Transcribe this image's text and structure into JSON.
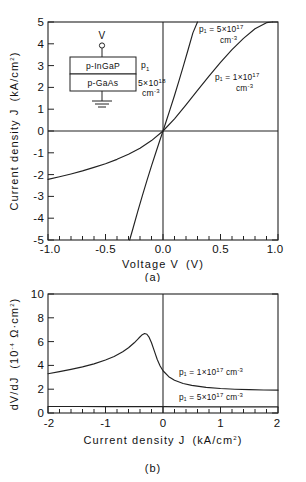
{
  "figure": {
    "panel_a_caption": "(a)",
    "panel_b_caption": "(b)"
  },
  "inset": {
    "terminal_label": "V",
    "top_layer": "p-InGaP",
    "bottom_layer": "p-GaAs",
    "p1_symbol": "p",
    "p1_subscript": "1",
    "doping_mantissa": "5×10",
    "doping_exponent": "18",
    "doping_units": "cm",
    "doping_units_exponent": "-3",
    "ground_name": "ground-symbol"
  },
  "chart_data": [
    {
      "type": "line",
      "panel": "(a)",
      "title": "",
      "xlabel": "Voltage V  (V)",
      "ylabel": "Current density J  (kA/cm²)",
      "xlabel_main": "Voltage V",
      "xlabel_unit": "(V)",
      "ylabel_main": "Current density J",
      "ylabel_unit": "(kA/cm",
      "ylabel_unit_sup": "2",
      "ylabel_unit_close": ")",
      "xlim": [
        -1.0,
        1.0
      ],
      "ylim": [
        -5,
        5
      ],
      "xticks": [
        -1.0,
        -0.5,
        0.0,
        0.5,
        1.0
      ],
      "xticklabels": [
        "-1.0",
        "-0.5",
        "0.0",
        "0.5",
        "1.0"
      ],
      "yticks": [
        -5,
        -4,
        -3,
        -2,
        -1,
        0,
        1,
        2,
        3,
        4,
        5
      ],
      "yticklabels": [
        "-5",
        "-4",
        "-3",
        "-2",
        "-1",
        "0",
        "1",
        "2",
        "3",
        "4",
        "5"
      ],
      "minor_xticks_per_interval": 5,
      "grid": false,
      "legend_position": "in-plot-annotations",
      "series": [
        {
          "name": "p1 = 5×10^17 cm^-3",
          "label_line1": "p₁ = 5×10",
          "label_sup": "17",
          "label_line2": "cm",
          "label_line2_sup": "-3",
          "x": [
            -0.29,
            -0.26,
            -0.22,
            -0.18,
            -0.14,
            -0.1,
            -0.06,
            -0.03,
            0.0,
            0.03,
            0.06,
            0.1,
            0.14,
            0.18,
            0.22,
            0.26,
            0.3
          ],
          "y": [
            -5.0,
            -4.45,
            -3.7,
            -2.98,
            -2.28,
            -1.6,
            -0.95,
            -0.47,
            0.0,
            0.48,
            0.97,
            1.63,
            2.32,
            3.03,
            3.76,
            4.5,
            5.0
          ]
        },
        {
          "name": "p1 = 1×10^17 cm^-3",
          "label_line1": "p₁ = 1×10",
          "label_sup": "17",
          "label_line2": "cm",
          "label_line2_sup": "-3",
          "x": [
            -1.0,
            -0.9,
            -0.8,
            -0.7,
            -0.6,
            -0.5,
            -0.4,
            -0.3,
            -0.2,
            -0.1,
            0.0,
            0.1,
            0.2,
            0.3,
            0.4,
            0.5,
            0.6,
            0.7,
            0.8,
            0.9,
            0.95
          ],
          "y": [
            -2.22,
            -2.1,
            -1.97,
            -1.83,
            -1.67,
            -1.5,
            -1.3,
            -1.07,
            -0.79,
            -0.44,
            0.0,
            0.56,
            1.2,
            1.86,
            2.52,
            3.15,
            3.73,
            4.25,
            4.69,
            4.97,
            5.0
          ]
        }
      ]
    },
    {
      "type": "line",
      "panel": "(b)",
      "title": "",
      "xlabel": "Current density J  (kA/cm²)",
      "ylabel": "dV/dJ  (10⁻⁴ Ω·cm²)",
      "xlabel_main": "Current density J",
      "xlabel_unit": "(kA/cm",
      "xlabel_unit_sup": "2",
      "xlabel_unit_close": ")",
      "ylabel_main": "dV/dJ",
      "ylabel_unit_open": "(10",
      "ylabel_unit_sup": "-4",
      "ylabel_unit_rest": " Ω·cm",
      "ylabel_unit_sup2": "2",
      "ylabel_unit_close": ")",
      "xlim": [
        -2,
        2
      ],
      "ylim": [
        0,
        10
      ],
      "xticks": [
        -2,
        -1,
        0,
        1,
        2
      ],
      "xticklabels": [
        "-2",
        "-1",
        "0",
        "1",
        "2"
      ],
      "yticks": [
        0,
        2,
        4,
        6,
        8,
        10
      ],
      "yticklabels": [
        "0",
        "2",
        "4",
        "6",
        "8",
        "10"
      ],
      "minor_xticks_per_interval": 5,
      "grid": false,
      "legend_position": "in-plot-annotations",
      "series": [
        {
          "name": "p1 = 1×10^17 cm^-3",
          "label_text": "p₁ = 1×10",
          "label_sup": "17",
          "label_tail": " cm",
          "label_tail_sup": "-3",
          "x": [
            -2.0,
            -1.8,
            -1.6,
            -1.4,
            -1.2,
            -1.0,
            -0.85,
            -0.7,
            -0.6,
            -0.5,
            -0.42,
            -0.36,
            -0.32,
            -0.28,
            -0.24,
            -0.2,
            -0.15,
            -0.1,
            -0.05,
            0.0,
            0.1,
            0.2,
            0.35,
            0.5,
            0.75,
            1.0,
            1.25,
            1.5,
            1.75,
            2.0
          ],
          "y": [
            3.3,
            3.48,
            3.67,
            3.88,
            4.13,
            4.45,
            4.75,
            5.15,
            5.48,
            5.9,
            6.3,
            6.58,
            6.68,
            6.62,
            6.35,
            5.9,
            5.2,
            4.5,
            3.95,
            3.55,
            3.05,
            2.75,
            2.48,
            2.32,
            2.15,
            2.06,
            2.0,
            1.96,
            1.93,
            1.92
          ]
        },
        {
          "name": "p1 = 5×10^17 cm^-3",
          "label_text": "p₁ = 5×10",
          "label_sup": "17",
          "label_tail": " cm",
          "label_tail_sup": "-3",
          "x": [
            -2.0,
            -1.5,
            -1.0,
            -0.5,
            0.0,
            0.5,
            1.0,
            1.5,
            2.0
          ],
          "y": [
            0.55,
            0.55,
            0.54,
            0.54,
            0.53,
            0.52,
            0.52,
            0.51,
            0.51
          ]
        }
      ]
    }
  ]
}
